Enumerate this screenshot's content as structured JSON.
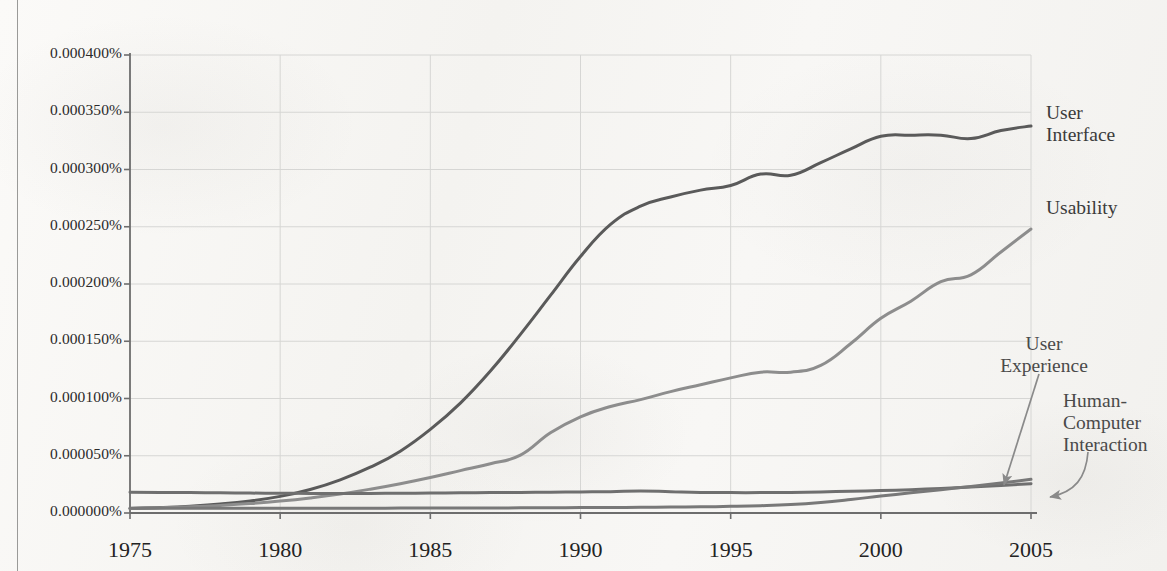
{
  "chart_data": {
    "type": "line",
    "title": "",
    "xlabel": "",
    "ylabel": "",
    "xlim": [
      1975,
      2005
    ],
    "ylim": [
      0.0,
      0.0004
    ],
    "grid": true,
    "legend_position": "right-inline-labels",
    "x_ticks": [
      "1975",
      "1980",
      "1985",
      "1990",
      "1995",
      "2000",
      "2005"
    ],
    "x_tick_values": [
      1975,
      1980,
      1985,
      1990,
      1995,
      2000,
      2005
    ],
    "y_ticks": [
      "0.000400%",
      "0.000350%",
      "0.000300%",
      "0.000250%",
      "0.000200%",
      "0.000150%",
      "0.000100%",
      "0.000050%",
      "0.000000%"
    ],
    "y_tick_values": [
      0.0004,
      0.00035,
      0.0003,
      0.00025,
      0.0002,
      0.00015,
      0.0001,
      5e-05,
      0.0
    ],
    "x": [
      1975,
      1976,
      1977,
      1978,
      1979,
      1980,
      1981,
      1982,
      1983,
      1984,
      1985,
      1986,
      1987,
      1988,
      1989,
      1990,
      1991,
      1992,
      1993,
      1994,
      1995,
      1996,
      1997,
      1998,
      1999,
      2000,
      2001,
      2002,
      2003,
      2004,
      2005
    ],
    "series": [
      {
        "name": "User Interface",
        "color": "#5a5a5a",
        "label": "User\nInterface",
        "values": [
          4e-06,
          4.8e-06,
          6e-06,
          7.8e-06,
          1.05e-05,
          1.45e-05,
          2.05e-05,
          2.9e-05,
          4e-05,
          5.4e-05,
          7.3e-05,
          9.6e-05,
          0.000124,
          0.000156,
          0.00019,
          0.000224,
          0.000252,
          0.000268,
          0.000276,
          0.000282,
          0.000286,
          0.000296,
          0.000295,
          0.000306,
          0.000318,
          0.000329,
          0.00033,
          0.00033,
          0.000327,
          0.000334,
          0.000338
        ]
      },
      {
        "name": "Usability",
        "color": "#8d8d8d",
        "label": "Usability",
        "values": [
          4e-06,
          4.6e-06,
          5.4e-06,
          6.6e-06,
          8.2e-06,
          1.04e-05,
          1.32e-05,
          1.66e-05,
          2.08e-05,
          2.56e-05,
          3.1e-05,
          3.7e-05,
          4.3e-05,
          5.05e-05,
          7e-05,
          8.4e-05,
          9.3e-05,
          9.9e-05,
          0.000106,
          0.000112,
          0.000118,
          0.000123,
          0.000123,
          0.000129,
          0.000148,
          0.00017,
          0.000185,
          0.000202,
          0.000208,
          0.000228,
          0.000248
        ]
      },
      {
        "name": "Human-Computer Interaction",
        "color": "#6f6f6f",
        "label": "Human-\nComputer\nInteraction",
        "values": [
          1.82e-05,
          1.8e-05,
          1.78e-05,
          1.76e-05,
          1.74e-05,
          1.72e-05,
          1.71e-05,
          1.7e-05,
          1.71e-05,
          1.72e-05,
          1.74e-05,
          1.76e-05,
          1.78e-05,
          1.8e-05,
          1.82e-05,
          1.84e-05,
          1.86e-05,
          1.92e-05,
          1.86e-05,
          1.8e-05,
          1.78e-05,
          1.78e-05,
          1.8e-05,
          1.84e-05,
          1.9e-05,
          1.96e-05,
          2.04e-05,
          2.14e-05,
          2.26e-05,
          2.4e-05,
          2.56e-05
        ]
      },
      {
        "name": "User Experience",
        "color": "#787878",
        "label": "User\nExperience",
        "values": [
          4.2e-06,
          4.2e-06,
          4.2e-06,
          4.2e-06,
          4.2e-06,
          4.2e-06,
          4.2e-06,
          4.2e-06,
          4.2e-06,
          4.3e-06,
          4.3e-06,
          4.4e-06,
          4.4e-06,
          4.5e-06,
          4.6e-06,
          4.7e-06,
          4.8e-06,
          5e-06,
          5.2e-06,
          5.4e-06,
          5.8e-06,
          6.4e-06,
          7.4e-06,
          9.2e-06,
          1.18e-05,
          1.48e-05,
          1.76e-05,
          2.04e-05,
          2.32e-05,
          2.62e-05,
          2.94e-05
        ]
      }
    ],
    "annotations": [
      {
        "name": "user-experience-arrow",
        "text": "User Experience",
        "kind": "straight-arrow",
        "points_to": [
          2003.1,
          2.25e-05
        ]
      },
      {
        "name": "human-computer-interaction-arrow",
        "text": "Human-Computer Interaction",
        "kind": "curved-arrow",
        "points_to": [
          2005.0,
          2.55e-05
        ]
      }
    ]
  },
  "labels": {
    "user_interface_line1": "User",
    "user_interface_line2": "Interface",
    "usability": "Usability",
    "user_experience_line1": "User",
    "user_experience_line2": "Experience",
    "hci_line1": "Human-",
    "hci_line2": "Computer",
    "hci_line3": "Interaction"
  },
  "colors": {
    "user_interface": "#5a5a5a",
    "usability": "#8d8d8d",
    "hci": "#6f6f6f",
    "user_experience": "#787878",
    "axis": "#6d6d6d",
    "grid": "#d6d6d4",
    "text": "#2b2b2b"
  }
}
